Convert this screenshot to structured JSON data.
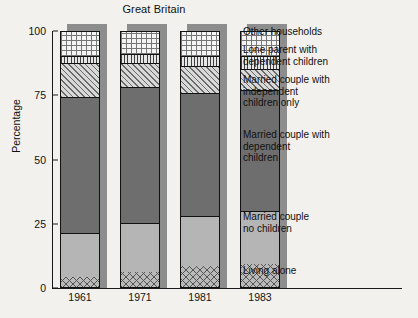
{
  "chart_data": {
    "type": "bar",
    "subtype": "stacked-bar-100",
    "title": "Great Britain",
    "xlabel": "",
    "ylabel": "Percentage",
    "ylim": [
      0,
      100
    ],
    "yticks": [
      0,
      25,
      50,
      75,
      100
    ],
    "ytick_labels": [
      "0",
      "25",
      "50",
      "75",
      "100"
    ],
    "grid": false,
    "legend_position": "right",
    "categories": [
      "1961",
      "1971",
      "1981",
      "1983"
    ],
    "series": [
      {
        "name": "Living alone",
        "pattern": "cross-hatch-diagonal",
        "values": [
          4,
          6,
          8,
          9
        ]
      },
      {
        "name": "Married couple no children",
        "pattern": "solid-light-grey",
        "values": [
          17,
          19,
          19.5,
          20.5
        ]
      },
      {
        "name": "Married couple with dependent children",
        "pattern": "solid-dark-grey",
        "values": [
          53,
          53,
          48,
          47
        ]
      },
      {
        "name": "Married couple with independent children only",
        "pattern": "diagonal-hatch",
        "values": [
          13,
          9,
          10.5,
          8.5
        ]
      },
      {
        "name": "Lone parent with dependent children",
        "pattern": "vertical-hatch",
        "values": [
          3,
          3.5,
          4,
          5
        ]
      },
      {
        "name": "Other households",
        "pattern": "grid-dots",
        "values": [
          10,
          9.5,
          10,
          10
        ]
      }
    ],
    "cumulative_tops": {
      "1961": [
        4,
        21,
        74,
        87,
        90,
        100
      ],
      "1971": [
        6,
        25,
        78,
        87,
        90.5,
        100
      ],
      "1981": [
        8,
        27.5,
        75.5,
        86,
        90,
        100
      ],
      "1983": [
        9,
        29.5,
        76.5,
        85,
        90,
        100
      ]
    }
  },
  "legend": {
    "items": [
      {
        "label": "Other households",
        "top_px": 0
      },
      {
        "label": "Lone parent with\ndependent children",
        "top_px": 18
      },
      {
        "label": "Married couple with\nindependent\nchildren only",
        "top_px": 48
      },
      {
        "label": "Married couple with\ndependent\nchildren",
        "top_px": 103
      },
      {
        "label": "Married couple\nno children",
        "top_px": 185
      },
      {
        "label": "Living alone",
        "top_px": 239
      }
    ]
  }
}
